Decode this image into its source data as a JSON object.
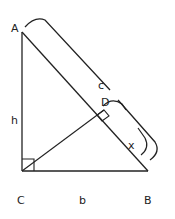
{
  "diagram": {
    "type": "right-triangle-altitude",
    "vertices": {
      "A": {
        "label": "A",
        "x": 22,
        "y": 32
      },
      "B": {
        "label": "B",
        "x": 148,
        "y": 171
      },
      "C": {
        "label": "C",
        "x": 22,
        "y": 171
      },
      "D": {
        "label": "D",
        "x": 104,
        "y": 110
      }
    },
    "segments": {
      "h": {
        "label": "h",
        "from": "A",
        "to": "C"
      },
      "b": {
        "label": "b",
        "from": "C",
        "to": "B"
      },
      "c": {
        "label": "c",
        "from": "A",
        "to": "B"
      },
      "x": {
        "label": "x",
        "from": "D",
        "to": "B"
      }
    },
    "right_angles": [
      "C",
      "D"
    ],
    "stroke_color": "#222222",
    "background_color": "#ffffff"
  }
}
